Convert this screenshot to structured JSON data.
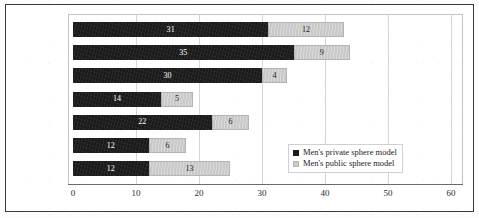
{
  "chart_data": {
    "type": "bar",
    "orientation": "horizontal",
    "stacked": true,
    "title": "",
    "subtitle": "",
    "xlabel": "",
    "ylabel": "",
    "categories": [
      "15 – 17",
      "18 – 24",
      "25 – 34",
      "35 – 44",
      "45 – 54",
      "55 – 64",
      "65 and more"
    ],
    "series": [
      {
        "name": "Men's private sphere model",
        "color": "#1a1a1a",
        "values": [
          31,
          35,
          30,
          14,
          22,
          12,
          12
        ]
      },
      {
        "name": "Men's public sphere model",
        "color": "#c9c9c9",
        "values": [
          12,
          9,
          4,
          5,
          6,
          6,
          13
        ]
      }
    ],
    "totals": [
      43,
      44,
      34,
      19,
      28,
      18,
      25
    ],
    "xlim": [
      0,
      60
    ],
    "xticks": [
      0,
      10,
      20,
      30,
      40,
      50,
      60
    ],
    "xtick_labels": [
      "0",
      "10",
      "20",
      "30",
      "40",
      "50",
      "60"
    ],
    "grid": "vertical",
    "legend_position": "inside-bottom-right",
    "data_labels": true
  },
  "legend": {
    "items": [
      {
        "label": "Men's private sphere model",
        "swatch": "private"
      },
      {
        "label": "Men's public sphere model",
        "swatch": "public"
      }
    ]
  },
  "colors": {
    "private_sphere": "#1a1a1a",
    "public_sphere": "#c9c9c9",
    "gridline": "#d6d6d6",
    "axis": "#6b6b6b",
    "frame": "#3a3a3a"
  }
}
